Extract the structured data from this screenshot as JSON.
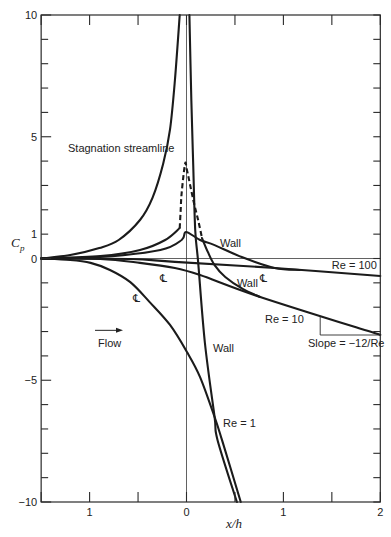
{
  "chart_data": {
    "type": "line",
    "title": "",
    "xlabel": "x/h",
    "ylabel": "C",
    "ylabel_subscript": "p",
    "xlim": [
      -1.5,
      2
    ],
    "ylim": [
      -10,
      10
    ],
    "grid": false,
    "legend": "none (curves labelled inline)",
    "x_ticks": [
      -1.5,
      -1,
      -0.5,
      0,
      0.5,
      1,
      1.5,
      2
    ],
    "x_tick_labels": [
      {
        "value": -1,
        "label": "1"
      },
      {
        "value": 0,
        "label": "0"
      },
      {
        "value": 1,
        "label": "1"
      },
      {
        "value": 2,
        "label": "2"
      }
    ],
    "y_ticks": [
      -10,
      -9,
      -8,
      -7,
      -6,
      -5,
      -4,
      -3,
      -2,
      -1,
      0,
      1,
      2,
      3,
      4,
      5,
      6,
      7,
      8,
      9,
      10
    ],
    "y_tick_labels": [
      {
        "value": 10,
        "label": "10"
      },
      {
        "value": 5,
        "label": "5"
      },
      {
        "value": 1,
        "label": "1"
      },
      {
        "value": 0,
        "label": "0"
      },
      {
        "value": -5,
        "label": "−5"
      },
      {
        "value": -10,
        "label": "−10"
      }
    ],
    "reference_lines": [
      {
        "orientation": "horizontal",
        "value": 0
      },
      {
        "orientation": "vertical",
        "value": 0
      }
    ],
    "series": [
      {
        "name": "Stagnation streamline (Re = 1)",
        "segments": [
          {
            "style": "solid",
            "points": [
              [
                -1.5,
                0
              ],
              [
                -1.2,
                0.14
              ],
              [
                -0.9,
                0.43
              ],
              [
                -0.7,
                0.76
              ],
              [
                -0.48,
                1.58
              ],
              [
                -0.35,
                2.5
              ],
              [
                -0.24,
                3.9
              ],
              [
                -0.17,
                5.3
              ],
              [
                -0.12,
                7.3
              ],
              [
                -0.07,
                10
              ]
            ]
          }
        ]
      },
      {
        "name": "Re = 1 wall",
        "segments": [
          {
            "style": "solid",
            "points": [
              [
                0.03,
                10
              ],
              [
                0.05,
                6.5
              ],
              [
                0.07,
                3.76
              ],
              [
                0.09,
                1.17
              ],
              [
                0.12,
                -0.14
              ],
              [
                0.19,
                -3.47
              ],
              [
                0.29,
                -6.51
              ],
              [
                0.32,
                -7.45
              ],
              [
                0.52,
                -10
              ]
            ]
          }
        ]
      },
      {
        "name": "Re = 1 centerline",
        "segments": [
          {
            "style": "solid",
            "points": [
              [
                -1.5,
                0
              ],
              [
                -1.2,
                -0.06
              ],
              [
                -0.99,
                -0.18
              ],
              [
                -0.79,
                -0.47
              ],
              [
                -0.58,
                -0.97
              ],
              [
                -0.38,
                -1.79
              ],
              [
                -0.17,
                -2.73
              ],
              [
                0.005,
                -3.84
              ],
              [
                0.14,
                -4.87
              ],
              [
                0.29,
                -6.51
              ],
              [
                0.366,
                -7.45
              ],
              [
                0.56,
                -10
              ]
            ]
          }
        ]
      },
      {
        "name": "Re = 10 wall",
        "segments": [
          {
            "style": "solid",
            "points": [
              [
                -1.5,
                0
              ],
              [
                -0.89,
                0.1
              ],
              [
                -0.48,
                0.35
              ],
              [
                -0.22,
                0.76
              ],
              [
                -0.07,
                1.25
              ]
            ]
          },
          {
            "style": "dashed",
            "points": [
              [
                -0.07,
                1.25
              ],
              [
                -0.06,
                1.99
              ],
              [
                -0.05,
                2.69
              ],
              [
                -0.015,
                3.88
              ],
              [
                0.005,
                3.63
              ],
              [
                0.07,
                2.4
              ],
              [
                0.12,
                1.58
              ],
              [
                0.16,
                0.84
              ]
            ]
          },
          {
            "style": "solid",
            "points": [
              [
                0.16,
                0.84
              ],
              [
                0.22,
                0.27
              ],
              [
                0.29,
                -0.27
              ],
              [
                0.4,
                -0.76
              ],
              [
                0.58,
                -1.25
              ],
              [
                0.76,
                -1.58
              ]
            ]
          }
        ]
      },
      {
        "name": "Re = 10 centerline",
        "segments": [
          {
            "style": "solid",
            "points": [
              [
                -1.5,
                0
              ],
              [
                -0.89,
                -0.02
              ],
              [
                -0.48,
                -0.18
              ],
              [
                -0.12,
                -0.39
              ],
              [
                0.14,
                -0.68
              ],
              [
                0.76,
                -1.58
              ],
              [
                2.0,
                -3.14
              ]
            ]
          }
        ]
      },
      {
        "name": "Re = 100 wall",
        "segments": [
          {
            "style": "solid",
            "points": [
              [
                -1.5,
                0
              ],
              [
                -0.89,
                0.06
              ],
              [
                -0.27,
                0.35
              ],
              [
                -0.05,
                0.76
              ],
              [
                -0.005,
                1.09
              ],
              [
                0.14,
                0.76
              ],
              [
                0.29,
                0.55
              ],
              [
                0.57,
                0.06
              ],
              [
                0.91,
                -0.39
              ],
              [
                1.17,
                -0.47
              ]
            ]
          }
        ]
      },
      {
        "name": "Re = 100 centerline",
        "segments": [
          {
            "style": "solid",
            "points": [
              [
                -1.5,
                0
              ],
              [
                -0.58,
                -0.02
              ],
              [
                -0.12,
                -0.14
              ],
              [
                0.91,
                -0.39
              ],
              [
                2.0,
                -0.72
              ]
            ]
          }
        ]
      }
    ],
    "annotations": [
      {
        "name": "stagnation-streamline-label",
        "text": "Stagnation streamline",
        "x": -1.223,
        "y": 4.37,
        "kind": "text"
      },
      {
        "name": "wall-label-re100",
        "text": "Wall",
        "x": 0.346,
        "y": 0.47,
        "kind": "text"
      },
      {
        "name": "wall-label-re10",
        "text": "Wall",
        "x": 0.52,
        "y": -1.17,
        "kind": "text"
      },
      {
        "name": "wall-label-re1",
        "text": "Wall",
        "x": 0.273,
        "y": -3.84,
        "kind": "text"
      },
      {
        "name": "re100-label",
        "text": "Re = 100",
        "x": 1.5,
        "y": -0.43,
        "kind": "text"
      },
      {
        "name": "re10-label",
        "text": "Re = 10",
        "x": 0.81,
        "y": -2.65,
        "kind": "text"
      },
      {
        "name": "re1-label",
        "text": "Re = 1",
        "x": 0.377,
        "y": -6.92,
        "kind": "text"
      },
      {
        "name": "slope-label",
        "text": "Slope = −12/Re",
        "x": 1.254,
        "y": -3.63,
        "kind": "text"
      },
      {
        "name": "flow-label",
        "text": "Flow",
        "x": -0.913,
        "y": -3.63,
        "kind": "text"
      },
      {
        "name": "centerline-symbol",
        "text": "℄",
        "x": -0.273,
        "y": -0.97,
        "kind": "symbol"
      },
      {
        "name": "centerline-symbol",
        "text": "℄",
        "x": 0.758,
        "y": -0.97,
        "kind": "symbol"
      },
      {
        "name": "centerline-symbol",
        "text": "℄",
        "x": -0.552,
        "y": -1.79,
        "kind": "symbol"
      }
    ],
    "flow_arrow": {
      "from": [
        -0.944,
        -2.95
      ],
      "to": [
        -0.655,
        -2.95
      ]
    },
    "slope_triangle": {
      "points": [
        [
          1.38,
          -2.37
        ],
        [
          1.38,
          -3.14
        ],
        [
          2.0,
          -3.14
        ]
      ]
    }
  }
}
